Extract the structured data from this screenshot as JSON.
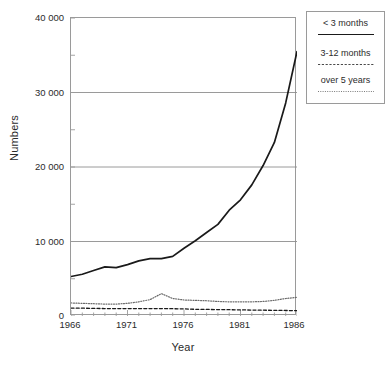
{
  "chart_data": {
    "type": "line",
    "title": "",
    "xlabel": "Year",
    "ylabel": "Numbers",
    "xlim": [
      1966,
      1986
    ],
    "ylim": [
      0,
      40000
    ],
    "grid": true,
    "grid_axis": "y",
    "legend_position": "outside-top-right",
    "x_tick_labels": [
      "1966",
      "1971",
      "1976",
      "1981",
      "1986"
    ],
    "x_tick_values": [
      1966,
      1971,
      1976,
      1981,
      1986
    ],
    "x_minor_tick_step": 1,
    "y_tick_labels": [
      "0",
      "10 000",
      "20 000",
      "30 000",
      "40 000"
    ],
    "y_tick_values": [
      0,
      10000,
      20000,
      30000,
      40000
    ],
    "y_minor_tick_step": 5000,
    "x": [
      1966,
      1967,
      1968,
      1969,
      1970,
      1971,
      1972,
      1973,
      1974,
      1975,
      1976,
      1977,
      1978,
      1979,
      1980,
      1981,
      1982,
      1983,
      1984,
      1985,
      1986
    ],
    "series": [
      {
        "name": "< 3 months",
        "style": "solid",
        "color": "#1a1a1a",
        "values": [
          5300,
          5600,
          6100,
          6600,
          6500,
          6900,
          7400,
          7700,
          7700,
          8000,
          9100,
          10100,
          11200,
          12300,
          14200,
          15600,
          17600,
          20200,
          23300,
          28600,
          35500
        ]
      },
      {
        "name": "3-12 months",
        "style": "dashed",
        "color": "#1a1a1a",
        "values": [
          1050,
          1050,
          1020,
          1000,
          1000,
          1000,
          1000,
          1000,
          1000,
          980,
          950,
          900,
          880,
          860,
          850,
          820,
          800,
          780,
          760,
          740,
          720
        ]
      },
      {
        "name": "over 5 years",
        "style": "dotted",
        "color": "#6a6a6a",
        "values": [
          1750,
          1700,
          1650,
          1600,
          1600,
          1700,
          1900,
          2200,
          3000,
          2350,
          2150,
          2100,
          2050,
          1950,
          1900,
          1900,
          1900,
          1950,
          2100,
          2350,
          2500
        ]
      }
    ]
  },
  "axes": {
    "y_title": "Numbers",
    "x_title": "Year",
    "y_tick_labels": [
      "40 000",
      "30 000",
      "20 000",
      "10 000",
      "0"
    ],
    "x_tick_labels": [
      "1966",
      "1971",
      "1976",
      "1981",
      "1986"
    ]
  },
  "legend": {
    "entries": [
      {
        "label": "< 3 months",
        "style": "solid"
      },
      {
        "label": "3-12 months",
        "style": "dashed"
      },
      {
        "label": "over 5 years",
        "style": "dotted"
      }
    ]
  },
  "colors": {
    "background": "#ffffff",
    "frame": "#9a9a9a",
    "gridline": "#8f8f8f",
    "text": "#2b2b2b",
    "series_solid": "#1a1a1a",
    "series_dashed": "#1a1a1a",
    "series_dotted": "#6a6a6a"
  }
}
